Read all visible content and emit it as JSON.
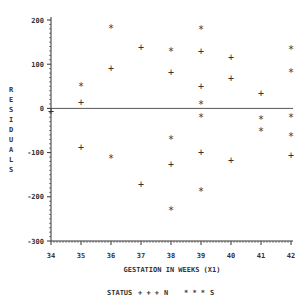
{
  "chart_data": {
    "type": "scatter",
    "title": "",
    "xlabel": "GESTATION IN WEEKS (X1)",
    "ylabel": "RESIDUALS",
    "xlim": [
      34,
      42
    ],
    "ylim": [
      -300,
      200
    ],
    "x_ticks": [
      "34",
      "35",
      "36",
      "37",
      "38",
      "39",
      "40",
      "41",
      "42"
    ],
    "y_ticks": [
      "200",
      "100",
      "0",
      "-100",
      "-200",
      "-300"
    ],
    "reference_line": {
      "y": 0
    },
    "grid": false,
    "legend": {
      "title": "STATUS",
      "position": "bottom",
      "entries": [
        {
          "label": "N",
          "symbol": "+ + +"
        },
        {
          "label": "S",
          "symbol": "* * *"
        }
      ]
    },
    "series": [
      {
        "name": "N",
        "marker": "+",
        "points": [
          {
            "x": 34,
            "y": -8
          },
          {
            "x": 35,
            "y": 14
          },
          {
            "x": 35,
            "y": -88
          },
          {
            "x": 36,
            "y": 90
          },
          {
            "x": 37,
            "y": 138
          },
          {
            "x": 37,
            "y": -172
          },
          {
            "x": 38,
            "y": 82
          },
          {
            "x": 38,
            "y": -128
          },
          {
            "x": 39,
            "y": 128
          },
          {
            "x": 39,
            "y": 50
          },
          {
            "x": 39,
            "y": -100
          },
          {
            "x": 40,
            "y": 116
          },
          {
            "x": 40,
            "y": 68
          },
          {
            "x": 40,
            "y": -118
          },
          {
            "x": 41,
            "y": 34
          },
          {
            "x": 42,
            "y": -106
          }
        ]
      },
      {
        "name": "S",
        "marker": "*",
        "points": [
          {
            "x": 35,
            "y": 50
          },
          {
            "x": 36,
            "y": 182
          },
          {
            "x": 36,
            "y": -112
          },
          {
            "x": 38,
            "y": 130
          },
          {
            "x": 38,
            "y": -70
          },
          {
            "x": 38,
            "y": -230
          },
          {
            "x": 39,
            "y": 180
          },
          {
            "x": 39,
            "y": 9
          },
          {
            "x": 39,
            "y": -20
          },
          {
            "x": 39,
            "y": -188
          },
          {
            "x": 41,
            "y": -25
          },
          {
            "x": 41,
            "y": -50
          },
          {
            "x": 42,
            "y": 134
          },
          {
            "x": 42,
            "y": 82
          },
          {
            "x": 42,
            "y": -20
          },
          {
            "x": 42,
            "y": -63
          }
        ]
      }
    ]
  },
  "labels": {
    "ylabel_letters": [
      "R",
      "E",
      "S",
      "I",
      "D",
      "U",
      "A",
      "L",
      "S"
    ],
    "xlabel": "GESTATION IN WEEKS (X1)",
    "legend_title": "STATUS",
    "legend_n_symbol": "+ + +",
    "legend_n_label": "N",
    "legend_s_symbol": "* * *",
    "legend_s_label": "S"
  },
  "colors": {
    "ink": "#333333",
    "refline": "#555555",
    "background": "#ffffff"
  }
}
